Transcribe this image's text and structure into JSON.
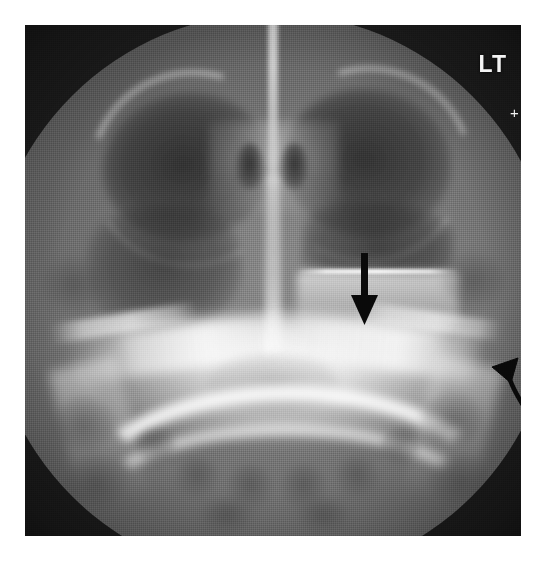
{
  "image": {
    "modality": "radiograph",
    "view": "Waters (occipitomental) view of the paranasal sinuses",
    "background_color": "#ffffff",
    "plate_background_color": "#1e1e1e",
    "field_of_view": "circular collimated field",
    "width": 546,
    "height": 561
  },
  "overlays": {
    "side_marker": {
      "label": "LT",
      "meaning": "left side marker",
      "color": "#f4f4f4",
      "position": "top-right"
    },
    "crosshair_marker": {
      "glyph": "+",
      "color": "#f0f0f0",
      "position": "right edge, below side marker"
    },
    "annotations": [
      {
        "id": "arrow-air-fluid",
        "type": "straight-arrow",
        "direction": "down",
        "color": "#0a0a0a",
        "points_to": "air-fluid level in the left maxillary sinus"
      },
      {
        "id": "arrow-lateral-wall",
        "type": "curved-arrow",
        "direction": "up-left",
        "color": "#0a0a0a",
        "points_to": "lateral maxillary wall / zygomatic region"
      }
    ]
  },
  "anatomy": {
    "structures": [
      {
        "name": "cranial vault soft tissue",
        "density": "intermediate"
      },
      {
        "name": "right orbit",
        "density": "lucent"
      },
      {
        "name": "left orbit",
        "density": "lucent"
      },
      {
        "name": "supraorbital rims",
        "density": "dense"
      },
      {
        "name": "nasal septum",
        "density": "dense"
      },
      {
        "name": "nasal cavity air columns",
        "density": "lucent"
      },
      {
        "name": "ethmoid air cells",
        "density": "mixed"
      },
      {
        "name": "right maxillary sinus",
        "density": "lucent, well aerated"
      },
      {
        "name": "left maxillary sinus",
        "density": "air above, opaque fluid below"
      },
      {
        "name": "air-fluid level",
        "density": "sharp horizontal interface"
      },
      {
        "name": "zygomatic arches",
        "density": "dense"
      },
      {
        "name": "petrous ridges / skull base",
        "density": "very dense"
      },
      {
        "name": "mandibular arch",
        "density": "dense"
      },
      {
        "name": "mandibular rami",
        "density": "dense"
      },
      {
        "name": "teeth / alveolar ridge",
        "density": "mixed"
      },
      {
        "name": "mastoid air cells",
        "density": "lucent"
      }
    ],
    "teeth_positions": [
      {
        "left": 150,
        "top": 432,
        "w": 44,
        "h": 40
      },
      {
        "left": 202,
        "top": 440,
        "w": 46,
        "h": 44
      },
      {
        "left": 256,
        "top": 440,
        "w": 46,
        "h": 44
      },
      {
        "left": 310,
        "top": 432,
        "w": 44,
        "h": 40
      },
      {
        "left": 112,
        "top": 404,
        "w": 38,
        "h": 34
      },
      {
        "left": 356,
        "top": 404,
        "w": 38,
        "h": 34
      },
      {
        "left": 176,
        "top": 474,
        "w": 52,
        "h": 34
      },
      {
        "left": 272,
        "top": 474,
        "w": 52,
        "h": 34
      }
    ],
    "mastoid_positions": [
      {
        "left": 28,
        "top": 372
      },
      {
        "left": 40,
        "top": 430
      },
      {
        "left": 396,
        "top": 368
      },
      {
        "left": 404,
        "top": 428
      },
      {
        "left": 18,
        "top": 232
      },
      {
        "left": 418,
        "top": 228
      }
    ]
  }
}
